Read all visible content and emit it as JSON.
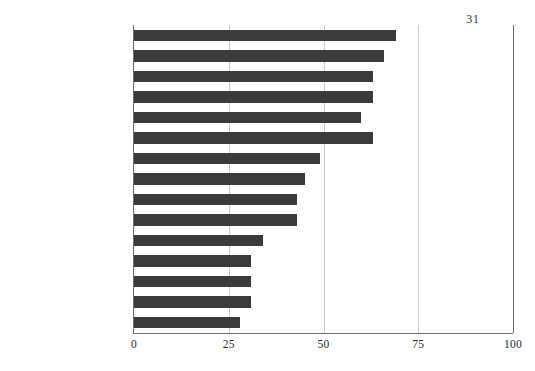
{
  "page": {
    "number": "31"
  },
  "chart_data": {
    "type": "bar",
    "orientation": "horizontal",
    "title": "",
    "xlabel": "",
    "ylabel": "",
    "xlim": [
      0,
      100
    ],
    "ylim": null,
    "grid": "vertical",
    "legend": "none",
    "xticks": [
      "0",
      "25",
      "50",
      "75",
      "100"
    ],
    "xtick_values": [
      0,
      25,
      50,
      75,
      100
    ],
    "bar_color": "#3b3b3b",
    "gridline_color": "#c9c9c9",
    "axis_color": "#6e6e6e",
    "categories": [
      "Programme (schedule)",
      "Tasks involved",
      "Communications",
      "Procurement method",
      "Project size",
      "Number of parties",
      "Client environment",
      "Project resource",
      "Clarity of brief",
      "Structure of project",
      "Structure of project team",
      "Project duration",
      "Cultural",
      "Social",
      "Management style"
    ],
    "values": [
      69,
      66,
      63,
      63,
      60,
      63,
      49,
      45,
      43,
      43,
      34,
      31,
      31,
      31,
      28
    ]
  }
}
